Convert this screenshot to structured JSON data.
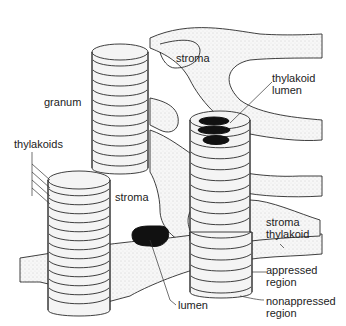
{
  "diagram": {
    "colors": {
      "ink": "#2a2a2a",
      "background": "#ffffff",
      "lumen_fill": "#111111",
      "stipple": "#bdbdbd"
    },
    "labels": {
      "stroma_top": "stroma",
      "granum": "granum",
      "thylakoid_lumen_line1": "thylakoid",
      "thylakoid_lumen_line2": "lumen",
      "thylakoids": "thylakoids",
      "stroma_middle": "stroma",
      "stroma_thylakoid_line1": "stroma",
      "stroma_thylakoid_line2": "thylakoid",
      "appressed_line1": "appressed",
      "appressed_line2": "region",
      "lumen": "lumen",
      "nonappressed_line1": "nonappressed",
      "nonappressed_line2": "region"
    },
    "structures": [
      {
        "name": "granum-top-left",
        "discs": 11
      },
      {
        "name": "granum-right-cutaway",
        "discs": 9,
        "cutaway_lumens": 3
      },
      {
        "name": "granum-bottom-left",
        "discs": 14
      },
      {
        "name": "granum-bottom-right",
        "discs": 6
      },
      {
        "name": "stroma-thylakoid-connections",
        "count": 4
      },
      {
        "name": "lumen-cross-section",
        "count": 1
      }
    ]
  }
}
